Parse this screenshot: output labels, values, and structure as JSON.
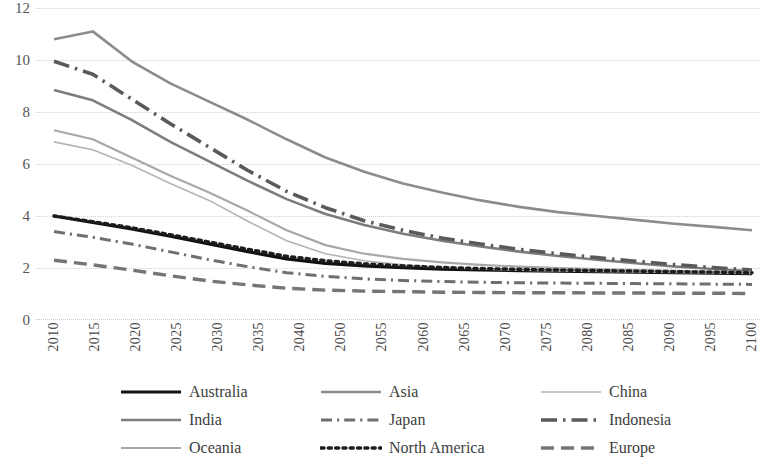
{
  "chart_data": {
    "type": "line",
    "title": "",
    "subtitle": "",
    "xlabel": "",
    "ylabel": "",
    "grid": true,
    "legend_position": "bottom",
    "xlim": [
      2010,
      2100
    ],
    "ylim": [
      0,
      12
    ],
    "y_ticks": [
      12,
      10,
      8,
      6,
      4,
      2,
      0
    ],
    "x_tick_labels": [
      "2010",
      "2015",
      "2020",
      "2025",
      "2030",
      "2035",
      "2040",
      "2050",
      "2055",
      "2060",
      "2065",
      "2070",
      "2075",
      "2080",
      "2085",
      "2090",
      "2095",
      "2100"
    ],
    "x": [
      2010,
      2015,
      2020,
      2025,
      2030,
      2035,
      2040,
      2045,
      2050,
      2055,
      2060,
      2065,
      2070,
      2075,
      2080,
      2085,
      2090,
      2095,
      2100
    ],
    "series": [
      {
        "name": "Australia",
        "color": "#111111",
        "style": "solid",
        "width": 3.2,
        "values": [
          4.0,
          3.75,
          3.5,
          3.22,
          2.93,
          2.63,
          2.35,
          2.18,
          2.08,
          2.01,
          1.96,
          1.93,
          1.9,
          1.88,
          1.86,
          1.84,
          1.82,
          1.8,
          1.78
        ]
      },
      {
        "name": "Asia",
        "color": "#8c8c8c",
        "style": "solid",
        "width": 2.6,
        "values": [
          10.8,
          11.1,
          9.95,
          9.1,
          8.4,
          7.7,
          6.95,
          6.25,
          5.7,
          5.25,
          4.9,
          4.6,
          4.35,
          4.15,
          4.0,
          3.85,
          3.7,
          3.58,
          3.45
        ]
      },
      {
        "name": "China",
        "color": "#b4b4b4",
        "style": "solid",
        "width": 1.6,
        "values": [
          6.85,
          6.55,
          5.95,
          5.25,
          4.6,
          3.8,
          3.05,
          2.55,
          2.28,
          2.12,
          2.02,
          1.96,
          1.92,
          1.89,
          1.87,
          1.85,
          1.83,
          1.81,
          1.79
        ]
      },
      {
        "name": "India",
        "color": "#7d7d7d",
        "style": "solid",
        "width": 2.6,
        "values": [
          8.85,
          8.45,
          7.7,
          6.85,
          6.1,
          5.35,
          4.65,
          4.08,
          3.65,
          3.32,
          3.05,
          2.83,
          2.63,
          2.46,
          2.32,
          2.18,
          2.06,
          1.96,
          1.87
        ]
      },
      {
        "name": "Japan",
        "color": "#6f6f6f",
        "style": "dashdot",
        "width": 3.0,
        "values": [
          3.4,
          3.18,
          2.92,
          2.62,
          2.32,
          2.05,
          1.82,
          1.68,
          1.58,
          1.52,
          1.48,
          1.45,
          1.43,
          1.42,
          1.41,
          1.4,
          1.39,
          1.38,
          1.37
        ]
      },
      {
        "name": "Indonesia",
        "color": "#5a5a5a",
        "style": "dashdot-long",
        "width": 3.6,
        "values": [
          9.95,
          9.45,
          8.5,
          7.55,
          6.65,
          5.75,
          4.95,
          4.32,
          3.82,
          3.45,
          3.15,
          2.92,
          2.72,
          2.55,
          2.4,
          2.26,
          2.13,
          2.02,
          1.92
        ]
      },
      {
        "name": "Oceania",
        "color": "#a8a8a8",
        "style": "solid",
        "width": 2.2,
        "values": [
          7.3,
          6.95,
          6.25,
          5.55,
          4.9,
          4.2,
          3.45,
          2.88,
          2.55,
          2.35,
          2.22,
          2.12,
          2.05,
          2.0,
          1.96,
          1.92,
          1.89,
          1.86,
          1.83
        ]
      },
      {
        "name": "North America",
        "color": "#1d1d1d",
        "style": "dotted",
        "width": 3.4,
        "values": [
          4.0,
          3.78,
          3.55,
          3.28,
          3.0,
          2.72,
          2.45,
          2.28,
          2.16,
          2.08,
          2.02,
          1.98,
          1.95,
          1.92,
          1.9,
          1.88,
          1.86,
          1.84,
          1.82
        ]
      },
      {
        "name": "Europe",
        "color": "#757575",
        "style": "longdash",
        "width": 3.4,
        "values": [
          2.3,
          2.12,
          1.92,
          1.7,
          1.5,
          1.35,
          1.22,
          1.15,
          1.11,
          1.09,
          1.07,
          1.06,
          1.05,
          1.05,
          1.04,
          1.04,
          1.03,
          1.03,
          1.02
        ]
      }
    ]
  },
  "legend": {
    "rows": [
      [
        {
          "label": "Australia",
          "series": "Australia"
        },
        {
          "label": "Asia",
          "series": "Asia"
        },
        {
          "label": "China",
          "series": "China"
        }
      ],
      [
        {
          "label": "India",
          "series": "India"
        },
        {
          "label": "Japan",
          "series": "Japan"
        },
        {
          "label": "Indonesia",
          "series": "Indonesia"
        }
      ],
      [
        {
          "label": "Oceania",
          "series": "Oceania"
        },
        {
          "label": "North America",
          "series": "North America"
        },
        {
          "label": "Europe",
          "series": "Europe"
        }
      ]
    ]
  }
}
